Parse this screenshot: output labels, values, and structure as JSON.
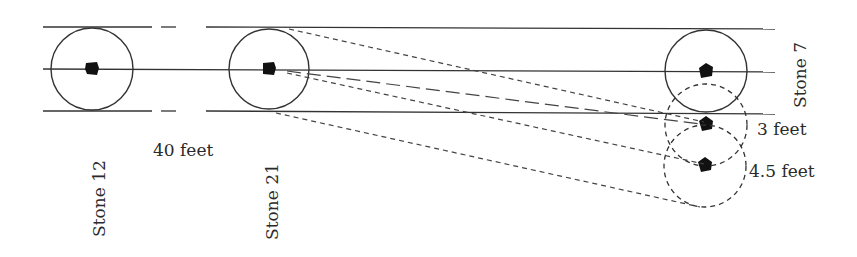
{
  "figure": {
    "type": "stone alignment diagram",
    "stroke_color": "#333333",
    "fill_color": "#111111"
  },
  "labels": {
    "stone_12": "Stone 12",
    "stone_21": "Stone 21",
    "stone_7": "Stone 7",
    "distance_40": "40 feet",
    "offset_3": "3 feet",
    "offset_4_5": "4.5 feet"
  },
  "stones": [
    {
      "id": "stone-12",
      "label": "Stone 12",
      "cx": 92,
      "cy": 69,
      "r": 41,
      "marker": "square"
    },
    {
      "id": "stone-21",
      "label": "Stone 21",
      "cx": 269,
      "cy": 69,
      "r": 41,
      "marker": "square"
    },
    {
      "id": "stone-7",
      "label": "Stone 7",
      "cx": 706,
      "cy": 71,
      "r": 42,
      "marker": "pentagon"
    }
  ],
  "projected_positions": [
    {
      "id": "position-3-feet",
      "label": "3 feet",
      "cx": 706,
      "cy": 125,
      "r": 41
    },
    {
      "id": "position-4-5-feet",
      "label": "4.5 feet",
      "cx": 705,
      "cy": 166,
      "r": 41
    }
  ],
  "guide_lines": {
    "top_y": 28,
    "center_y": 69,
    "bottom_y": 111,
    "x_start": 43,
    "x_end": 775,
    "gap_between_stones": "dashed"
  }
}
